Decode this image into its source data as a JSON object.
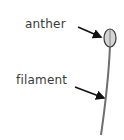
{
  "diagram": {
    "labels": {
      "anther": "anther",
      "filament": "filament"
    },
    "colors": {
      "anther_fill": "#d4d4d4",
      "outline": "#3a3a3a",
      "filament": "#6e6e6e",
      "arrow": "#111111",
      "text": "#3a3a3a"
    }
  }
}
